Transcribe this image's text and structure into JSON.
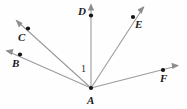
{
  "figure": {
    "width": 187,
    "height": 109,
    "background_color": "#fefefe",
    "ray_color": "#9b9b9b",
    "dot_color": "#141414",
    "label_color": "#1a1a1a"
  },
  "vertex": {
    "name": "A",
    "label": "A",
    "x": 91,
    "y": 88,
    "label_x": 87,
    "label_y": 95
  },
  "angle_marks": [
    {
      "label": "1",
      "between": "ray-AC and ray-AD",
      "label_x": 81,
      "label_y": 64
    }
  ],
  "rays": [
    {
      "id": "ray-AB",
      "label": "B",
      "point_x": 20,
      "point_y": 55,
      "tip_x": 6,
      "tip_y": 50,
      "label_x": 12,
      "label_y": 58
    },
    {
      "id": "ray-AC",
      "label": "C",
      "point_x": 28,
      "point_y": 29,
      "tip_x": 16,
      "tip_y": 20,
      "label_x": 18,
      "label_y": 32
    },
    {
      "id": "ray-AD",
      "label": "D",
      "point_x": 91,
      "point_y": 16,
      "tip_x": 91,
      "tip_y": 4,
      "label_x": 78,
      "label_y": 6
    },
    {
      "id": "ray-AE",
      "label": "E",
      "point_x": 133,
      "point_y": 17,
      "tip_x": 144,
      "tip_y": 7,
      "label_x": 135,
      "label_y": 19
    },
    {
      "id": "ray-AF",
      "label": "F",
      "point_x": 163,
      "point_y": 70,
      "tip_x": 178,
      "tip_y": 66,
      "label_x": 160,
      "label_y": 73
    }
  ]
}
